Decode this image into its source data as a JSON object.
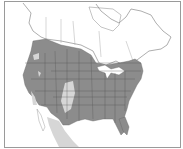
{
  "map": {
    "title": "Species range map",
    "region": "North America",
    "colors": {
      "background": "#ffffff",
      "range_main": "#8c8c8c",
      "range_secondary": "#d6d6d6",
      "borders": "#555555",
      "outline": "#9a9a9a"
    },
    "legend": {
      "dark": "Primary range",
      "light": "Secondary range"
    }
  }
}
